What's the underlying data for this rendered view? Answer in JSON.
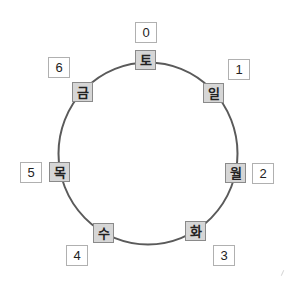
{
  "diagram": {
    "type": "cycle",
    "circle": {
      "stroke": "#5a5a5a",
      "stroke_width": 2
    },
    "colors": {
      "day_box_fill": "#d6d6d6",
      "day_box_border": "#8a8a8a",
      "number_box_fill": "#ffffff",
      "number_box_border": "#b0b0b0"
    },
    "nodes": [
      {
        "day": "토",
        "index": "0"
      },
      {
        "day": "일",
        "index": "1"
      },
      {
        "day": "월",
        "index": "2"
      },
      {
        "day": "화",
        "index": "3"
      },
      {
        "day": "수",
        "index": "4"
      },
      {
        "day": "목",
        "index": "5"
      },
      {
        "day": "금",
        "index": "6"
      }
    ]
  }
}
